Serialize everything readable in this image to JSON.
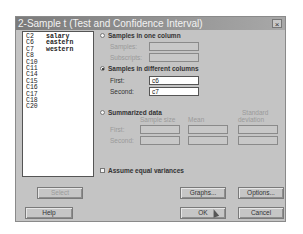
{
  "dialog": {
    "title": "2-Sample t (Test and Confidence Interval)",
    "close_glyph": "×"
  },
  "column_list": [
    {
      "id": "C2",
      "name": "salary"
    },
    {
      "id": "C6",
      "name": "eastern"
    },
    {
      "id": "C7",
      "name": "western"
    },
    {
      "id": "C8",
      "name": ""
    },
    {
      "id": "C10",
      "name": ""
    },
    {
      "id": "C11",
      "name": ""
    },
    {
      "id": "C14",
      "name": ""
    },
    {
      "id": "C15",
      "name": ""
    },
    {
      "id": "C16",
      "name": ""
    },
    {
      "id": "C17",
      "name": ""
    },
    {
      "id": "C18",
      "name": ""
    },
    {
      "id": "C20",
      "name": ""
    }
  ],
  "options": {
    "one_column": {
      "label": "Samples in one column",
      "selected": false,
      "samples_label": "Samples:",
      "samples_value": "",
      "subscripts_label": "Subscripts:",
      "subscripts_value": ""
    },
    "different_columns": {
      "label": "Samples in different columns",
      "selected": true,
      "first_label": "First:",
      "first_value": "c6",
      "second_label": "Second:",
      "second_value": "c7"
    },
    "summarized": {
      "label": "Summarized data",
      "selected": false,
      "col_sample_size": "Sample size",
      "col_mean": "Mean",
      "col_std_line1": "Standard",
      "col_std_line2": "deviation",
      "first_label": "First:",
      "second_label": "Second:"
    },
    "equal_variances": {
      "label": "Assume equal variances",
      "checked": false
    }
  },
  "buttons": {
    "select": "Select",
    "help": "Help",
    "graphs": "Graphs...",
    "options": "Options...",
    "ok": "OK",
    "cancel": "Cancel"
  }
}
